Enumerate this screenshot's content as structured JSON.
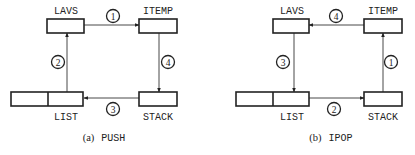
{
  "diagrams": [
    {
      "id": "a",
      "caption_prefix": "(a)",
      "caption_name": "PUSH",
      "labels": {
        "lavs": "LAVS",
        "itemp": "ITEMP",
        "list": "LIST",
        "stack": "STACK"
      },
      "steps": [
        {
          "num": "1",
          "from": "LAVS",
          "to": "ITEMP"
        },
        {
          "num": "2",
          "from": "LIST",
          "to": "LAVS"
        },
        {
          "num": "3",
          "from": "STACK",
          "to": "LIST"
        },
        {
          "num": "4",
          "from": "ITEMP",
          "to": "STACK"
        }
      ]
    },
    {
      "id": "b",
      "caption_prefix": "(b)",
      "caption_name": "IPOP",
      "labels": {
        "lavs": "LAVS",
        "itemp": "ITEMP",
        "list": "LIST",
        "stack": "STACK"
      },
      "steps": [
        {
          "num": "1",
          "from": "STACK",
          "to": "ITEMP"
        },
        {
          "num": "2",
          "from": "LIST",
          "to": "STACK"
        },
        {
          "num": "3",
          "from": "LAVS",
          "to": "LIST"
        },
        {
          "num": "4",
          "from": "ITEMP",
          "to": "LAVS"
        }
      ]
    }
  ]
}
